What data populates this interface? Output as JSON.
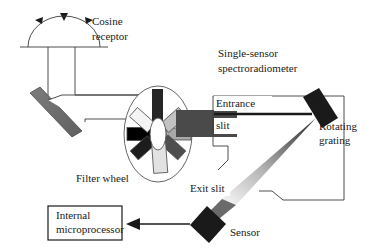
{
  "diagram": {
    "background_color": "#ffffff",
    "line_color": "#3a3a3a",
    "text_color": "#1a1a1a"
  },
  "labels": {
    "cosine_receptor": "Cosine\nreceptor",
    "cosine_receptor_line1": "Cosine",
    "cosine_receptor_line2": "receptor",
    "spectroradiometer_line1": "Single-sensor",
    "spectroradiometer_line2": "spectroradiometer",
    "entrance_slit_line1": "Entrance",
    "entrance_slit_line2": "slit",
    "rotating_grating_line1": "Rotating",
    "rotating_grating_line2": "grating",
    "exit_slit": "Exit slit",
    "sensor": "Sensor",
    "filter_wheel": "Filter wheel",
    "microprocessor_line1": "Internal",
    "microprocessor_line2": "microprocessor"
  },
  "components": {
    "cosine_receptor": {
      "name": "Cosine receptor",
      "shape": "dome",
      "incoming_light_arrows": 3,
      "arrow_directions": [
        "left",
        "down",
        "right"
      ]
    },
    "mirror": {
      "name": "Folding mirror",
      "shape": "tilted-bar",
      "color": "#6e6e6e",
      "angle_deg": -55
    },
    "filter_wheel": {
      "name": "Filter wheel",
      "shape": "ellipse",
      "hub": "ellipse",
      "filter_count": 7,
      "filters": [
        {
          "position": "upper-left",
          "color": "#1c1c1c",
          "angle_deg": -38
        },
        {
          "position": "upper-right",
          "color": "#4e4e4e",
          "angle_deg": 40
        },
        {
          "position": "left",
          "color": "#000000",
          "angle_deg": 0
        },
        {
          "position": "right",
          "color": "#a8a8a8",
          "angle_deg": 0
        },
        {
          "position": "lower-right",
          "color": "#c2c2c2",
          "angle_deg": -36
        },
        {
          "position": "lower-left",
          "color": "#f2f2f2",
          "angle_deg": 36
        },
        {
          "position": "bottom",
          "color": "#e0e0e0",
          "angle_deg": 84
        }
      ],
      "aperture_bar_color": "#262626"
    },
    "entrance_duct": {
      "name": "Entrance slit duct",
      "color": "#4a4a4a"
    },
    "rotating_grating": {
      "name": "Rotating grating",
      "shape": "tilted-rectangle",
      "color": "#1a1a1a",
      "angle_deg": 55
    },
    "dispersed_beam": {
      "name": "Dispersed light cone",
      "shape": "tapered-cone",
      "gradient_from": "#2b2b2b",
      "gradient_to": "#e8e8e8"
    },
    "exit_slit": {
      "name": "Exit slit"
    },
    "sensor": {
      "name": "Sensor",
      "shape": "diamond",
      "color": "#1a1a1a"
    },
    "microprocessor": {
      "name": "Internal microprocessor",
      "shape": "rectangle-box",
      "border_color": "#1a1a1a",
      "fill": "#ffffff"
    },
    "signal_arrow": {
      "name": "Signal path to microprocessor",
      "direction": "left"
    }
  }
}
